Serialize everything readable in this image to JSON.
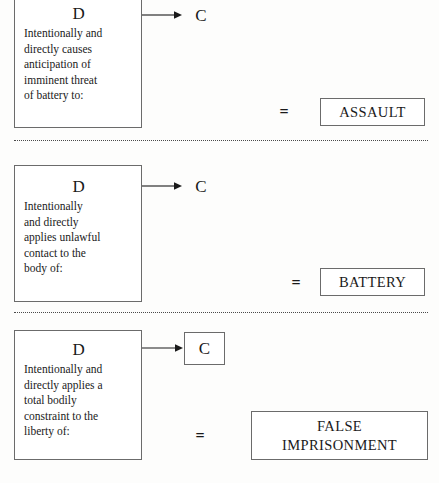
{
  "document": {
    "title": "Intentional Torts to the Person",
    "background_color": "#fdfdfc",
    "ink_color": "#1a1a1a",
    "border_color": "#6b6b6b"
  },
  "sections": [
    {
      "id": "assault",
      "actor": {
        "label": "D",
        "lines": [
          "Intentionally and",
          "directly causes",
          "anticipation of",
          "imminent threat",
          "of battery to:"
        ]
      },
      "arrow": {
        "name": "rightwards-arrow"
      },
      "target": {
        "label": "C",
        "boxed": false
      },
      "operator": "=",
      "result": {
        "lines": [
          "ASSAULT"
        ]
      }
    },
    {
      "id": "battery",
      "actor": {
        "label": "D",
        "lines": [
          "Intentionally",
          "and directly",
          "applies unlawful",
          "contact to the",
          "body of:"
        ]
      },
      "arrow": {
        "name": "rightwards-arrow"
      },
      "target": {
        "label": "C",
        "boxed": false
      },
      "operator": "=",
      "result": {
        "lines": [
          "BATTERY"
        ]
      }
    },
    {
      "id": "false-imprisonment",
      "actor": {
        "label": "D",
        "lines": [
          "Intentionally and",
          "directly applies a",
          "total bodily",
          "constraint to the",
          "liberty of:"
        ]
      },
      "arrow": {
        "name": "rightwards-arrow"
      },
      "target": {
        "label": "C",
        "boxed": true
      },
      "operator": "=",
      "result": {
        "lines": [
          "FALSE",
          "IMPRISONMENT"
        ]
      }
    }
  ]
}
